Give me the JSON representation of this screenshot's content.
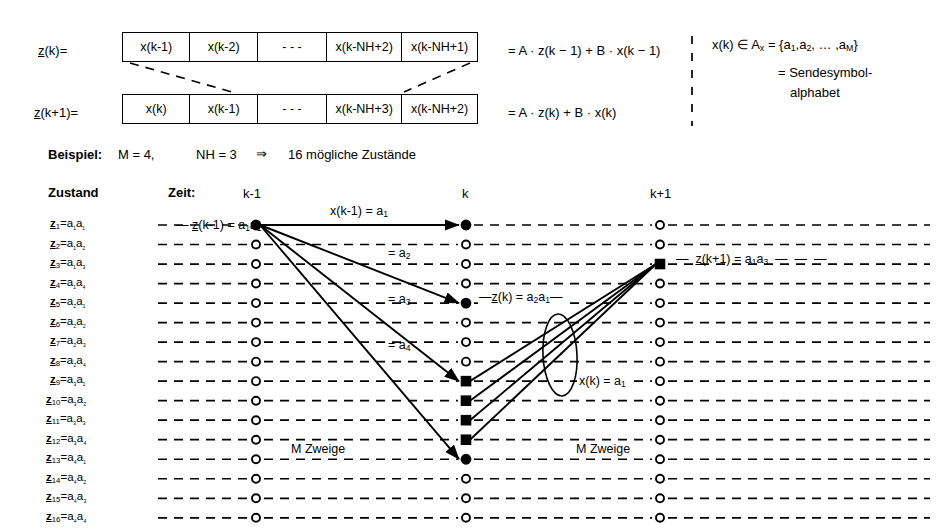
{
  "equations": {
    "row1_label": "z(k)=",
    "row2_label": "z(k+1)=",
    "row1_cells": [
      "x(k-1)",
      "x(k-2)",
      "- - -",
      "x(k-NH+2)",
      "x(k-NH+1)"
    ],
    "row2_cells": [
      "x(k)",
      "x(k-1)",
      "- - -",
      "x(k-NH+3)",
      "x(k-NH+2)"
    ],
    "row1_rhs": "= A · z(k − 1)  +  B · x(k − 1)",
    "row2_rhs": "= A · z(k)  +  B · x(k)"
  },
  "alphabet": {
    "line1": "x(k) ∈ A",
    "line1_sub": "x",
    "line1_set": " = {a₁,a₂, … ,a",
    "line1_set_end": "}",
    "set_text": "x(k) ∈ Aₓ = {a₁,a₂, … ,aₘ}",
    "line2": "= Sendesymbol-",
    "line3": "alphabet"
  },
  "example": {
    "title": "Beispiel:",
    "m": "M = 4,",
    "nh": "NH = 3",
    "arrow": "⇒",
    "result": "16 mögliche Zustände"
  },
  "headers": {
    "state_col": "Zustand",
    "time_col": "Zeit:",
    "times": [
      "k-1",
      "k",
      "k+1"
    ]
  },
  "states": [
    {
      "index": "1",
      "value": "a₁a₁"
    },
    {
      "index": "2",
      "value": "a₁a₂"
    },
    {
      "index": "3",
      "value": "a₁a₃"
    },
    {
      "index": "4",
      "value": "a₁a₄"
    },
    {
      "index": "5",
      "value": "a₂a₁"
    },
    {
      "index": "6",
      "value": "a₂a₂"
    },
    {
      "index": "7",
      "value": "a₂a₃"
    },
    {
      "index": "8",
      "value": "a₂a₄"
    },
    {
      "index": "9",
      "value": "a₃a₁"
    },
    {
      "index": "10",
      "value": "a₃a₂"
    },
    {
      "index": "11",
      "value": "a₃a₃"
    },
    {
      "index": "12",
      "value": "a₃a₄"
    },
    {
      "index": "13",
      "value": "a₄a₁"
    },
    {
      "index": "14",
      "value": "a₄a₂"
    },
    {
      "index": "15",
      "value": "a₄a₃"
    },
    {
      "index": "16",
      "value": "a₄a₄"
    }
  ],
  "annotations": {
    "start_state": "z(k-1) = a₁a₁",
    "branch_top": "x(k-1) = a₁",
    "branch_2": "= a₂",
    "branch_3": "= a₃",
    "branch_4": "= a₄",
    "mid_state": "z(k) = a₂a₁",
    "end_state": "z(k+1) = a₁a₃",
    "merge_label": "x(k) = a₁",
    "branches_left": "M Zweige",
    "branches_right": "M Zweige"
  }
}
